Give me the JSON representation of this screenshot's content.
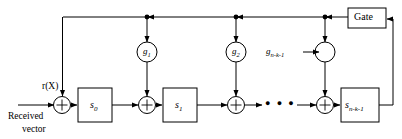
{
  "figure": {
    "input": {
      "signal_label": "r(X)",
      "caption_line1": "Received",
      "caption_line2": "vector"
    },
    "gate": {
      "label": "Gate"
    },
    "registers": [
      {
        "id": "s0",
        "label_base": "s",
        "label_sub": "0",
        "cx": 95,
        "cy": 105
      },
      {
        "id": "s1",
        "label_base": "s",
        "label_sub": "1",
        "cx": 180,
        "cy": 105
      },
      {
        "id": "snk1",
        "label_base": "s",
        "label_sub": "n-k-1",
        "cx": 360,
        "cy": 105
      }
    ],
    "adders": [
      {
        "id": "adder-in",
        "label": "+",
        "cx": 62,
        "cy": 105
      },
      {
        "id": "adder-g1",
        "label": "+",
        "cx": 147,
        "cy": 105
      },
      {
        "id": "adder-g2",
        "label": "+",
        "cx": 236,
        "cy": 105
      },
      {
        "id": "adder-gn",
        "label": "+",
        "cx": 325,
        "cy": 105
      }
    ],
    "multipliers": [
      {
        "id": "g1",
        "label_base": "g",
        "label_sub": "1",
        "cx": 147,
        "cy": 52,
        "label_inside": true
      },
      {
        "id": "g2",
        "label_base": "g",
        "label_sub": "2",
        "cx": 236,
        "cy": 52,
        "label_inside": true
      },
      {
        "id": "gnk1",
        "label_base": "g",
        "label_sub": "n-k-1",
        "cx": 325,
        "cy": 52,
        "label_inside": false
      }
    ],
    "ellipsis": {
      "label": "●  ●  ●",
      "cx": 282,
      "cy": 105
    },
    "colors": {
      "stroke": "#000000",
      "fill": "#ffffff",
      "background": "#ffffff"
    }
  }
}
